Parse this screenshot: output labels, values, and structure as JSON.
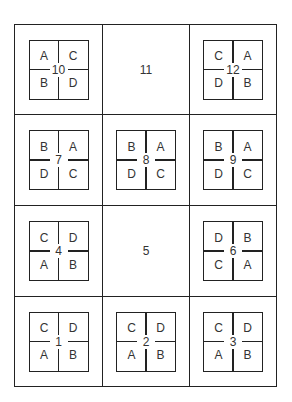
{
  "cells": [
    {
      "id": "10",
      "type": "box",
      "tl": "A",
      "tr": "C",
      "bl": "B",
      "br": "D"
    },
    {
      "id": "11",
      "type": "plain"
    },
    {
      "id": "12",
      "type": "box",
      "tl": "C",
      "tr": "A",
      "bl": "D",
      "br": "B"
    },
    {
      "id": "7",
      "type": "box",
      "tl": "B",
      "tr": "A",
      "bl": "D",
      "br": "C"
    },
    {
      "id": "8",
      "type": "box",
      "tl": "B",
      "tr": "A",
      "bl": "D",
      "br": "C"
    },
    {
      "id": "9",
      "type": "box",
      "tl": "B",
      "tr": "A",
      "bl": "D",
      "br": "C"
    },
    {
      "id": "4",
      "type": "box",
      "tl": "C",
      "tr": "D",
      "bl": "A",
      "br": "B"
    },
    {
      "id": "5",
      "type": "plain"
    },
    {
      "id": "6",
      "type": "box",
      "tl": "D",
      "tr": "B",
      "bl": "C",
      "br": "A"
    },
    {
      "id": "1",
      "type": "box",
      "tl": "C",
      "tr": "D",
      "bl": "A",
      "br": "B"
    },
    {
      "id": "2",
      "type": "box",
      "tl": "C",
      "tr": "D",
      "bl": "A",
      "br": "B"
    },
    {
      "id": "3",
      "type": "box",
      "tl": "C",
      "tr": "D",
      "bl": "A",
      "br": "B"
    }
  ]
}
